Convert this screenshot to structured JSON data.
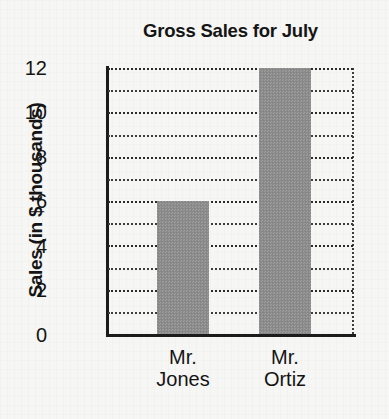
{
  "chart_data": {
    "type": "bar",
    "title": "Gross Sales for July",
    "xlabel": "",
    "ylabel": "Sales (in $ thousands)",
    "categories": [
      "Mr. Jones",
      "Mr. Ortiz"
    ],
    "category_lines": [
      [
        "Mr.",
        "Jones"
      ],
      [
        "Mr.",
        "Ortiz"
      ]
    ],
    "values": [
      6,
      12
    ],
    "ylim": [
      0,
      12
    ],
    "yticks": [
      0,
      2,
      4,
      6,
      8,
      10,
      12
    ],
    "ytick_labels": [
      "0",
      "2",
      "4",
      "6",
      "8",
      "10",
      "12"
    ],
    "gridlines": [
      1,
      2,
      3,
      4,
      5,
      6,
      7,
      8,
      9,
      10,
      11,
      12
    ],
    "grid": true,
    "grid_style": "dotted",
    "legend": null,
    "bar_color": "#8d8d8d",
    "axis_color": "#1c1c1c",
    "grid_color": "#3d3d3d",
    "background_color": "#f6f6f4",
    "text_color": "#141414"
  }
}
